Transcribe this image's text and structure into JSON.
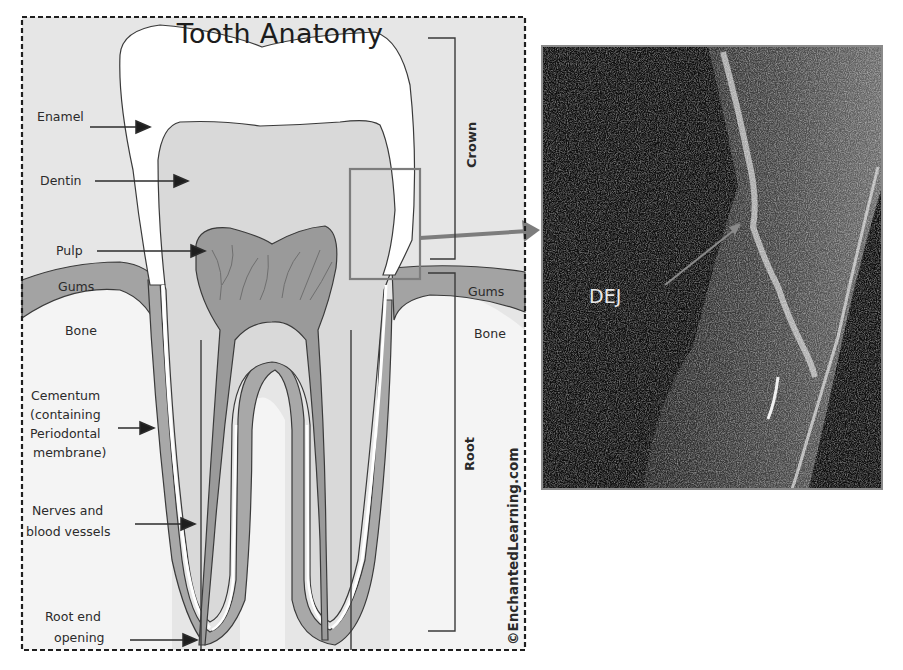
{
  "figure": {
    "title": "Tooth Anatomy",
    "labels_left": [
      {
        "id": "enamel",
        "text": "Enamel"
      },
      {
        "id": "dentin",
        "text": "Dentin"
      },
      {
        "id": "pulp",
        "text": "Pulp"
      },
      {
        "id": "gums",
        "text": "Gums"
      },
      {
        "id": "bone",
        "text": "Bone"
      },
      {
        "id": "cementum",
        "lines": [
          "Cementum",
          "(containing",
          "Periodontal",
          "membrane)"
        ]
      },
      {
        "id": "nerves",
        "lines": [
          "Nerves and",
          "blood vessels"
        ]
      },
      {
        "id": "root-end",
        "lines": [
          "Root end",
          "opening"
        ]
      }
    ],
    "labels_right": [
      {
        "id": "gums-right",
        "text": "Gums"
      },
      {
        "id": "bone-right",
        "text": "Bone"
      }
    ],
    "brackets": {
      "crown": "Crown",
      "root": "Root"
    },
    "copyright": "©EnchantedLearning.com"
  },
  "oct_image": {
    "annotation": "DEJ"
  },
  "colors": {
    "background_fill": "#e6e6e6",
    "enamel": "#ffffff",
    "dentin": "#d9d9d9",
    "pulp": "#9a9a9a",
    "gums": "#a3a3a3",
    "bone": "#f4f4f4",
    "outline": "#3a3a3a",
    "highlight_box": "#7d7d7d",
    "oct_border": "#8a8a8a"
  }
}
